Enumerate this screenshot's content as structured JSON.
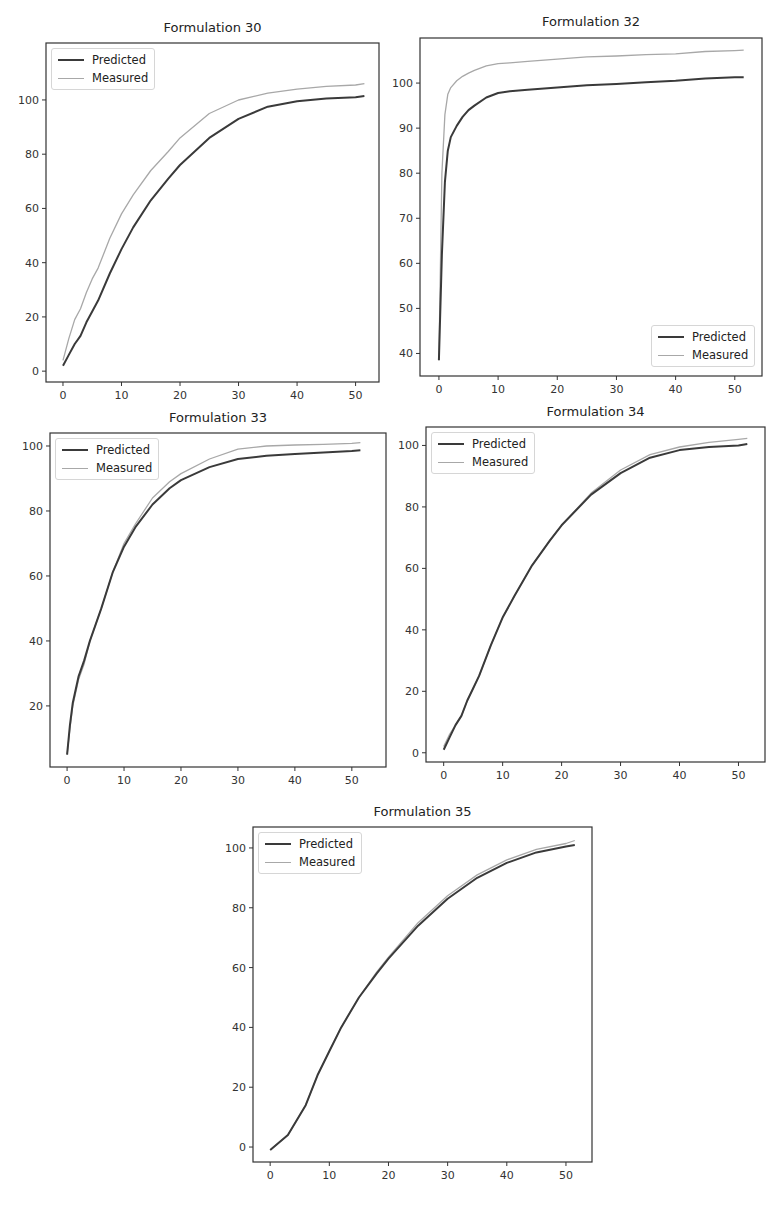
{
  "figure": {
    "legend": {
      "predicted_label": "Predicted",
      "measured_label": "Measured"
    },
    "colors": {
      "predicted": "#3a3a3a",
      "measured": "#a8a8a8",
      "axes": "#333333",
      "background": "#ffffff"
    }
  },
  "chart_data": [
    {
      "type": "line",
      "title": "Formulation 30",
      "xlabel": "",
      "ylabel": "",
      "x_ticks": [
        0,
        10,
        20,
        30,
        40,
        50
      ],
      "y_ticks": [
        0,
        20,
        40,
        60,
        80,
        100
      ],
      "xlim": [
        -2.9,
        54
      ],
      "ylim": [
        -4,
        121
      ],
      "grid": false,
      "legend_position": "upper left",
      "x": [
        0,
        1,
        2,
        3,
        4,
        5,
        6,
        8,
        10,
        12,
        15,
        18,
        20,
        25,
        30,
        35,
        40,
        45,
        50,
        51.5
      ],
      "series": [
        {
          "name": "Predicted",
          "values": [
            2,
            6,
            10,
            13,
            18,
            22,
            26,
            36,
            45,
            53,
            63,
            71,
            76,
            86,
            93,
            97.5,
            99.5,
            100.5,
            101,
            101.5
          ]
        },
        {
          "name": "Measured",
          "values": [
            4,
            12,
            19,
            23,
            29,
            34,
            38,
            49,
            58,
            65,
            74,
            81,
            86,
            95,
            100,
            102.5,
            104,
            105,
            105.5,
            106
          ]
        }
      ]
    },
    {
      "type": "line",
      "title": "Formulation 32",
      "xlabel": "",
      "ylabel": "",
      "x_ticks": [
        0,
        10,
        20,
        30,
        40,
        50
      ],
      "y_ticks": [
        40,
        50,
        60,
        70,
        80,
        90,
        100
      ],
      "xlim": [
        -3.2,
        54.6
      ],
      "ylim": [
        35,
        110
      ],
      "grid": false,
      "legend_position": "lower right",
      "x": [
        0,
        0.5,
        1,
        1.5,
        2,
        3,
        4,
        5,
        6,
        8,
        10,
        12,
        15,
        20,
        25,
        30,
        35,
        40,
        45,
        50,
        51.5
      ],
      "series": [
        {
          "name": "Predicted",
          "values": [
            38.5,
            62,
            78,
            85,
            88,
            90.5,
            92.5,
            94,
            95,
            96.8,
            97.8,
            98.2,
            98.5,
            99,
            99.5,
            99.8,
            100.2,
            100.5,
            101,
            101.3,
            101.3
          ]
        },
        {
          "name": "Measured",
          "values": [
            38.5,
            80,
            93,
            97.5,
            99,
            100.5,
            101.5,
            102.2,
            102.8,
            103.8,
            104.3,
            104.5,
            104.8,
            105.3,
            105.8,
            106,
            106.3,
            106.5,
            107,
            107.2,
            107.3
          ]
        }
      ]
    },
    {
      "type": "line",
      "title": "Formulation 33",
      "xlabel": "",
      "ylabel": "",
      "x_ticks": [
        0,
        10,
        20,
        30,
        40,
        50
      ],
      "y_ticks": [
        20,
        40,
        60,
        80,
        100
      ],
      "xlim": [
        -3,
        56
      ],
      "ylim": [
        1.2,
        104
      ],
      "grid": false,
      "legend_position": "upper left",
      "x": [
        0,
        0.5,
        1,
        2,
        3,
        4,
        5,
        6,
        8,
        10,
        12,
        15,
        18,
        20,
        25,
        30,
        35,
        40,
        45,
        50,
        51.5
      ],
      "series": [
        {
          "name": "Predicted",
          "values": [
            5,
            14,
            21,
            29,
            34,
            40,
            45,
            50,
            61,
            69,
            75,
            82,
            87,
            89.5,
            93.5,
            96,
            97,
            97.5,
            98,
            98.5,
            98.7
          ]
        },
        {
          "name": "Measured",
          "values": [
            5,
            13,
            20,
            28,
            33,
            40,
            45,
            50,
            61,
            70,
            76,
            84,
            89,
            91.5,
            96,
            99,
            100,
            100.3,
            100.5,
            100.8,
            101
          ]
        }
      ]
    },
    {
      "type": "line",
      "title": "Formulation 34",
      "xlabel": "",
      "ylabel": "",
      "x_ticks": [
        0,
        10,
        20,
        30,
        40,
        50
      ],
      "y_ticks": [
        0,
        20,
        40,
        60,
        80,
        100
      ],
      "xlim": [
        -3,
        54.5
      ],
      "ylim": [
        -3,
        106
      ],
      "grid": false,
      "legend_position": "upper left",
      "x": [
        0,
        1,
        2,
        3,
        4,
        5,
        6,
        8,
        10,
        12,
        15,
        18,
        20,
        25,
        30,
        35,
        40,
        45,
        50,
        51.5
      ],
      "series": [
        {
          "name": "Predicted",
          "values": [
            1,
            5,
            9,
            12,
            17,
            21,
            25,
            35,
            44,
            51,
            61,
            69,
            74,
            84,
            91,
            96,
            98.5,
            99.5,
            100,
            100.5
          ]
        },
        {
          "name": "Measured",
          "values": [
            2,
            6,
            9,
            12,
            17,
            21,
            25,
            35,
            44,
            51,
            61,
            69,
            74,
            84.5,
            92,
            97,
            99.5,
            101,
            102,
            102.3
          ]
        }
      ]
    },
    {
      "type": "line",
      "title": "Formulation 35",
      "xlabel": "",
      "ylabel": "",
      "x_ticks": [
        0,
        10,
        20,
        30,
        40,
        50
      ],
      "y_ticks": [
        0,
        20,
        40,
        60,
        80,
        100
      ],
      "xlim": [
        -2.9,
        54.4
      ],
      "ylim": [
        -5,
        107
      ],
      "grid": false,
      "legend_position": "upper left",
      "x": [
        0,
        3,
        6,
        8,
        10,
        12,
        15,
        18,
        20,
        25,
        30,
        35,
        40,
        45,
        50,
        51.5
      ],
      "series": [
        {
          "name": "Predicted",
          "values": [
            -1,
            4,
            14,
            24,
            32,
            40,
            50,
            58,
            63,
            74,
            83,
            90,
            95,
            98.5,
            100.5,
            101
          ]
        },
        {
          "name": "Measured",
          "values": [
            -1,
            4,
            14,
            24,
            32,
            40,
            50,
            58.5,
            63.5,
            75,
            84,
            91,
            96,
            99.5,
            101.5,
            102.5
          ]
        }
      ]
    }
  ]
}
